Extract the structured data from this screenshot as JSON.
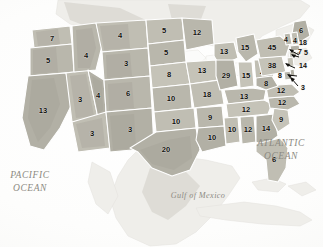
{
  "map": {
    "title": "United States electoral vote map",
    "background_color": "#ffffff",
    "state_fill_color": "#b9b7ac",
    "state_border_color": "#ffffff",
    "value_text_color": "#12110f",
    "ocean_label_color": "#8c8a82"
  },
  "water_labels": [
    {
      "name": "pacific-ocean-label",
      "line1": "PACIFIC",
      "line2": "OCEAN"
    },
    {
      "name": "atlantic-ocean-label",
      "line1": "ATLANTIC",
      "line2": "OCEAN"
    },
    {
      "name": "gulf-of-mexico-label",
      "line1": "Gulf of Mexico",
      "line2": ""
    }
  ],
  "states": [
    {
      "code": "WA",
      "value": "7"
    },
    {
      "code": "OR",
      "value": "5"
    },
    {
      "code": "CA",
      "value": "13"
    },
    {
      "code": "NV",
      "value": "3"
    },
    {
      "code": "ID",
      "value": "4"
    },
    {
      "code": "MT",
      "value": "4"
    },
    {
      "code": "WY",
      "value": "3"
    },
    {
      "code": "UT",
      "value": "4"
    },
    {
      "code": "AZ",
      "value": "3"
    },
    {
      "code": "CO",
      "value": "6"
    },
    {
      "code": "NM",
      "value": "3"
    },
    {
      "code": "ND",
      "value": "5"
    },
    {
      "code": "SD",
      "value": "5"
    },
    {
      "code": "NE",
      "value": "8"
    },
    {
      "code": "KS",
      "value": "10"
    },
    {
      "code": "OK",
      "value": "10"
    },
    {
      "code": "TX",
      "value": "20"
    },
    {
      "code": "MN",
      "value": "12"
    },
    {
      "code": "IA",
      "value": "13"
    },
    {
      "code": "MO",
      "value": "18"
    },
    {
      "code": "AR",
      "value": "9"
    },
    {
      "code": "LA",
      "value": "10"
    },
    {
      "code": "WI",
      "value": "13"
    },
    {
      "code": "IL",
      "value": "29"
    },
    {
      "code": "MI",
      "value": "15"
    },
    {
      "code": "IN",
      "value": "15"
    },
    {
      "code": "OH",
      "value": "24"
    },
    {
      "code": "KY",
      "value": "13"
    },
    {
      "code": "TN",
      "value": "12"
    },
    {
      "code": "MS",
      "value": "10"
    },
    {
      "code": "AL",
      "value": "12"
    },
    {
      "code": "GA",
      "value": "14"
    },
    {
      "code": "FL",
      "value": "6"
    },
    {
      "code": "SC",
      "value": "9"
    },
    {
      "code": "NC",
      "value": "12"
    },
    {
      "code": "VA",
      "value": "12"
    },
    {
      "code": "WV",
      "value": "8"
    },
    {
      "code": "PA",
      "value": "38"
    },
    {
      "code": "NY",
      "value": "45"
    },
    {
      "code": "ME",
      "value": "6"
    },
    {
      "code": "VT",
      "value": "4"
    },
    {
      "code": "NH",
      "value": "4"
    }
  ],
  "callouts": [
    {
      "code": "MA",
      "value": "18"
    },
    {
      "code": "RI",
      "value": "5"
    },
    {
      "code": "CT",
      "value": "7"
    },
    {
      "code": "NJ",
      "value": "14"
    },
    {
      "code": "MD",
      "value": "8"
    },
    {
      "code": "DE",
      "value": "3"
    }
  ]
}
